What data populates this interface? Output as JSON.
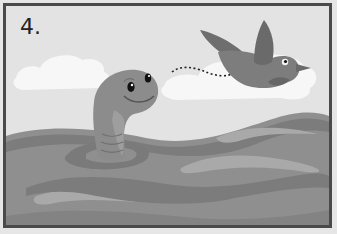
{
  "panel": {
    "number_label": "4.",
    "colors": {
      "frame": "#4a4a4a",
      "sky": "#e3e3e3",
      "cloud": "#f7f7f7",
      "water": "#8f8f8f",
      "water_dark": "#7c7c7c",
      "water_light": "#a9a9a9",
      "worm": "#8c8c8c",
      "worm_belly": "#a2a2a2",
      "bird": "#7d7d7d",
      "bird_dark": "#6a6a6a"
    }
  },
  "scene": {
    "characters": [
      "worm",
      "bird"
    ],
    "elements": [
      "clouds",
      "water-waves",
      "dotted-flight-path"
    ]
  }
}
